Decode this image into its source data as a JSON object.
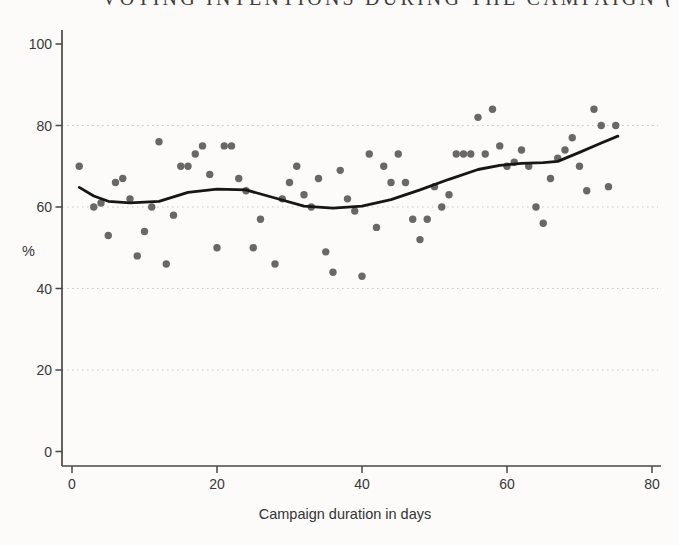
{
  "chart_data": {
    "type": "scatter",
    "title_fragment": "VOTING INTENTIONS DURING THE CAMPAIGN (",
    "xlabel": "Campaign duration in days",
    "ylabel": "%",
    "xlim": [
      0,
      81
    ],
    "ylim": [
      0,
      103
    ],
    "x_ticks": [
      0,
      20,
      40,
      60,
      80
    ],
    "y_ticks": [
      100,
      80,
      60,
      40,
      20,
      0
    ],
    "gridlines_y": [
      20,
      40,
      60,
      80
    ],
    "grid": "dotted-horizontal",
    "legend": "none",
    "points": [
      [
        1,
        70
      ],
      [
        3,
        60
      ],
      [
        4,
        61
      ],
      [
        5,
        53
      ],
      [
        6,
        66
      ],
      [
        7,
        67
      ],
      [
        8,
        62
      ],
      [
        9,
        48
      ],
      [
        10,
        54
      ],
      [
        11,
        60
      ],
      [
        12,
        76
      ],
      [
        13,
        46
      ],
      [
        14,
        58
      ],
      [
        15,
        70
      ],
      [
        16,
        70
      ],
      [
        17,
        73
      ],
      [
        18,
        75
      ],
      [
        19,
        68
      ],
      [
        20,
        50
      ],
      [
        21,
        75
      ],
      [
        22,
        75
      ],
      [
        23,
        67
      ],
      [
        24,
        64
      ],
      [
        25,
        50
      ],
      [
        26,
        57
      ],
      [
        28,
        46
      ],
      [
        29,
        62
      ],
      [
        30,
        66
      ],
      [
        31,
        70
      ],
      [
        32,
        63
      ],
      [
        33,
        60
      ],
      [
        34,
        67
      ],
      [
        35,
        49
      ],
      [
        36,
        44
      ],
      [
        37,
        69
      ],
      [
        38,
        62
      ],
      [
        39,
        59
      ],
      [
        40,
        43
      ],
      [
        41,
        73
      ],
      [
        42,
        55
      ],
      [
        43,
        70
      ],
      [
        44,
        66
      ],
      [
        45,
        73
      ],
      [
        46,
        66
      ],
      [
        47,
        57
      ],
      [
        48,
        52
      ],
      [
        49,
        57
      ],
      [
        50,
        65
      ],
      [
        51,
        60
      ],
      [
        52,
        63
      ],
      [
        53,
        73
      ],
      [
        54,
        73
      ],
      [
        55,
        73
      ],
      [
        56,
        82
      ],
      [
        57,
        73
      ],
      [
        58,
        84
      ],
      [
        59,
        75
      ],
      [
        60,
        70
      ],
      [
        61,
        71
      ],
      [
        62,
        74
      ],
      [
        63,
        70
      ],
      [
        64,
        60
      ],
      [
        65,
        56
      ],
      [
        66,
        67
      ],
      [
        67,
        72
      ],
      [
        68,
        74
      ],
      [
        69,
        77
      ],
      [
        70,
        70
      ],
      [
        71,
        64
      ],
      [
        72,
        84
      ],
      [
        73,
        80
      ],
      [
        74,
        65
      ],
      [
        75,
        80
      ]
    ],
    "smooth_line": [
      [
        1,
        64.8
      ],
      [
        3,
        62.7
      ],
      [
        5,
        61.4
      ],
      [
        8,
        61.0
      ],
      [
        12,
        61.4
      ],
      [
        16,
        63.6
      ],
      [
        20,
        64.4
      ],
      [
        24,
        64.2
      ],
      [
        28,
        62.2
      ],
      [
        32,
        60.2
      ],
      [
        36,
        59.7
      ],
      [
        40,
        60.2
      ],
      [
        44,
        61.8
      ],
      [
        48,
        64.2
      ],
      [
        52,
        66.8
      ],
      [
        56,
        69.2
      ],
      [
        59,
        70.2
      ],
      [
        62,
        70.7
      ],
      [
        65,
        70.9
      ],
      [
        67,
        71.2
      ],
      [
        70,
        73.4
      ],
      [
        73,
        75.7
      ],
      [
        75.3,
        77.4
      ]
    ],
    "colors": {
      "point": "#5c5c5c",
      "line": "#161616",
      "axis": "#474747",
      "grid": "#c9c9c9",
      "text": "#383838",
      "background": "#fcfbf9"
    }
  }
}
